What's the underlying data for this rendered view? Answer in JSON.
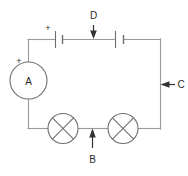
{
  "diagram": {
    "type": "electrical-circuit-schematic",
    "background_color": "#ffffff",
    "wire_color": "#9a9a9a",
    "symbol_color": "#6e6e6e",
    "label_color": "#2b2b2b",
    "arrow_color": "#333333"
  },
  "labels": {
    "ammeter": "A",
    "ammeter_polarity": "+",
    "cell_polarity": "+",
    "callout_b": "B",
    "callout_c": "C",
    "callout_d": "D"
  },
  "components": [
    {
      "id": "ammeter",
      "name": "ammeter",
      "symbol": "circle-with-letter",
      "letter": "A",
      "polarity_marker": "+",
      "position": "left-side"
    },
    {
      "id": "cell-left",
      "name": "cell",
      "symbol": "battery-cell",
      "polarity_marker": "+",
      "position": "top-left"
    },
    {
      "id": "cell-right",
      "name": "cell",
      "symbol": "battery-cell",
      "polarity_marker": "",
      "position": "top-right"
    },
    {
      "id": "lamp-left",
      "name": "lamp",
      "symbol": "circle-with-cross",
      "position": "bottom-left"
    },
    {
      "id": "lamp-right",
      "name": "lamp",
      "symbol": "circle-with-cross",
      "position": "bottom-right"
    }
  ],
  "callouts": [
    {
      "id": "callout-d",
      "label": "D",
      "arrow_direction": "down",
      "points_to": "top-wire-between-cells"
    },
    {
      "id": "callout-c",
      "label": "C",
      "arrow_direction": "left",
      "points_to": "right-vertical-wire"
    },
    {
      "id": "callout-b",
      "label": "B",
      "arrow_direction": "up",
      "points_to": "bottom-wire-between-lamps"
    }
  ]
}
